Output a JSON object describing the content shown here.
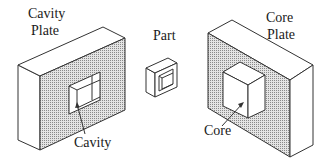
{
  "diagram": {
    "type": "mold-components-isometric",
    "labels": {
      "cavity_plate_line1": "Cavity",
      "cavity_plate_line2": "Plate",
      "part": "Part",
      "core_plate_line1": "Core",
      "core_plate_line2": "Plate",
      "cavity": "Cavity",
      "core": "Core"
    },
    "components": [
      {
        "id": "cavity-plate",
        "label": "Cavity Plate",
        "feature": "Cavity (recessed pocket)"
      },
      {
        "id": "part",
        "label": "Part",
        "feature": "Hollow rectangular shell"
      },
      {
        "id": "core-plate",
        "label": "Core Plate",
        "feature": "Core (protruding block)"
      }
    ],
    "colors": {
      "stroke": "#333333",
      "text": "#1a1a1a",
      "background": "#ffffff",
      "stipple": "#8a8a8a"
    }
  }
}
